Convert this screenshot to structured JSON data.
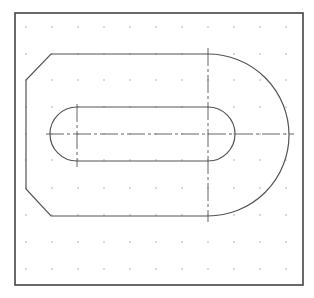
{
  "drawing": {
    "width": 314,
    "height": 298,
    "background": "#ffffff",
    "frame": {
      "x": 15,
      "y": 13,
      "w": 288,
      "h": 272,
      "color": "#444444",
      "stroke": 1.6
    },
    "grid": {
      "xs": [
        26,
        52,
        78,
        104,
        130,
        156,
        182,
        208,
        234,
        260,
        286
      ],
      "ys": [
        27,
        54,
        80,
        107,
        134,
        160,
        188,
        215,
        242,
        269
      ],
      "dot_color": "#9a9a9a",
      "dot_radius": 0.7
    },
    "outline": {
      "color": "#555555",
      "stroke": 1.2,
      "points": {
        "top_left_chamfer_start": [
          51,
          54
        ],
        "top_arc_start": [
          208,
          54
        ],
        "arc_end_bottom": [
          208,
          216
        ],
        "bottom_left_chamfer_start": [
          51,
          216
        ],
        "left_bottom": [
          26,
          189
        ],
        "left_top": [
          26,
          80
        ]
      },
      "arc_radius": 81
    },
    "slot": {
      "color": "#555555",
      "stroke": 1.2,
      "left_center": [
        77,
        134
      ],
      "right_center": [
        208,
        134
      ],
      "radius": 27
    },
    "centerlines": {
      "color": "#555555",
      "stroke": 0.9,
      "dash": "18 3 3 3",
      "horizontal": {
        "x1": 46,
        "x2": 294,
        "y": 134
      },
      "vertical_left": {
        "x": 77,
        "y1": 104,
        "y2": 167
      },
      "vertical_right": {
        "x": 208,
        "y1": 48,
        "y2": 222
      }
    }
  }
}
